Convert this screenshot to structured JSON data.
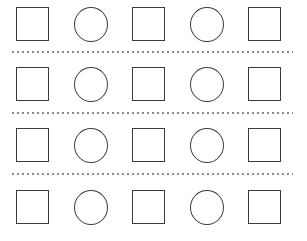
{
  "page": {
    "background_color": "#ffffff",
    "width": 307,
    "height": 241
  },
  "style": {
    "shape_stroke_color": "#3c3c3c",
    "shape_fill_color": "#ffffff",
    "separator_color": "#8a8a8a",
    "shape_stroke_width": 1.4
  },
  "grid": {
    "row_count": 4,
    "column_count": 5,
    "separator_count": 3,
    "pattern_description": "square circle square circle square"
  },
  "rows": [
    {
      "index": 1,
      "has_separator_below": true,
      "cells": [
        {
          "shape": "square",
          "label": "square"
        },
        {
          "shape": "circle",
          "label": "circle"
        },
        {
          "shape": "square",
          "label": "square"
        },
        {
          "shape": "circle",
          "label": "circle"
        },
        {
          "shape": "square",
          "label": "square"
        }
      ]
    },
    {
      "index": 2,
      "has_separator_below": true,
      "cells": [
        {
          "shape": "square",
          "label": "square"
        },
        {
          "shape": "circle",
          "label": "circle"
        },
        {
          "shape": "square",
          "label": "square"
        },
        {
          "shape": "circle",
          "label": "circle"
        },
        {
          "shape": "square",
          "label": "square"
        }
      ]
    },
    {
      "index": 3,
      "has_separator_below": true,
      "cells": [
        {
          "shape": "square",
          "label": "square"
        },
        {
          "shape": "circle",
          "label": "circle"
        },
        {
          "shape": "square",
          "label": "square"
        },
        {
          "shape": "circle",
          "label": "circle"
        },
        {
          "shape": "square",
          "label": "square"
        }
      ]
    },
    {
      "index": 4,
      "has_separator_below": false,
      "cells": [
        {
          "shape": "square",
          "label": "square"
        },
        {
          "shape": "circle",
          "label": "circle"
        },
        {
          "shape": "square",
          "label": "square"
        },
        {
          "shape": "circle",
          "label": "circle"
        },
        {
          "shape": "square",
          "label": "square"
        }
      ]
    }
  ]
}
